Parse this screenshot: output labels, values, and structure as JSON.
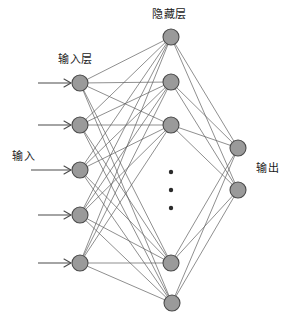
{
  "diagram": {
    "labels": {
      "hidden_layer": "隐藏层",
      "input_layer": "输入层",
      "input": "输入",
      "output": "输出"
    },
    "colors": {
      "node_fill": "#9a9a9a",
      "node_stroke": "#4a4a4a",
      "edge": "#5f5f5f",
      "background": "#ffffff",
      "text": "#1a1a1a",
      "dot": "#2b2b2b"
    },
    "node_radius": 8,
    "layers": [
      {
        "name": "input-layer",
        "x": 80,
        "count": 5,
        "nodes": [
          {
            "id": "i1",
            "cx": 80,
            "cy": 83
          },
          {
            "id": "i2",
            "cx": 80,
            "cy": 125
          },
          {
            "id": "i3",
            "cx": 80,
            "cy": 170
          },
          {
            "id": "i4",
            "cx": 80,
            "cy": 215
          },
          {
            "id": "i5",
            "cx": 80,
            "cy": 263
          }
        ]
      },
      {
        "name": "hidden-layer",
        "x": 171,
        "count": 5,
        "nodes": [
          {
            "id": "h1",
            "cx": 171,
            "cy": 37
          },
          {
            "id": "h2",
            "cx": 171,
            "cy": 82
          },
          {
            "id": "h3",
            "cx": 171,
            "cy": 125
          },
          {
            "id": "h4",
            "cx": 171,
            "cy": 263
          },
          {
            "id": "h5",
            "cx": 172,
            "cy": 303
          }
        ],
        "ellipsis": [
          {
            "cx": 171,
            "cy": 172,
            "r": 2.2
          },
          {
            "cx": 171,
            "cy": 190,
            "r": 2.2
          },
          {
            "cx": 171,
            "cy": 208,
            "r": 2.2
          }
        ]
      },
      {
        "name": "output-layer",
        "x": 238,
        "count": 2,
        "nodes": [
          {
            "id": "o1",
            "cx": 238,
            "cy": 148
          },
          {
            "id": "o2",
            "cx": 238,
            "cy": 190
          }
        ]
      }
    ],
    "input_arrows": [
      {
        "x1": 38,
        "y1": 83,
        "x2": 71,
        "y2": 83
      },
      {
        "x1": 38,
        "y1": 125,
        "x2": 71,
        "y2": 125
      },
      {
        "x1": 31,
        "y1": 170,
        "x2": 71,
        "y2": 170
      },
      {
        "x1": 38,
        "y1": 215,
        "x2": 71,
        "y2": 215
      },
      {
        "x1": 38,
        "y1": 263,
        "x2": 71,
        "y2": 263
      }
    ]
  }
}
